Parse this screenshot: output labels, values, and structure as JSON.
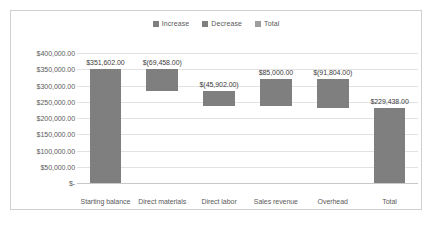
{
  "chart_data": {
    "type": "bar",
    "subtype": "waterfall",
    "title": "",
    "xlabel": "",
    "ylabel": "",
    "grid": true,
    "legend_position": "top-center",
    "ylim": [
      0,
      400000
    ],
    "ytick_values": [
      400000,
      350000,
      300000,
      250000,
      200000,
      150000,
      100000,
      50000,
      0
    ],
    "ytick_labels": [
      "$400,000.00",
      "$350,000.00",
      "$300,000.00",
      "$250,000.00",
      "$200,000.00",
      "$150,000.00",
      "$100,000.00",
      "$50,000.00",
      "$-"
    ],
    "categories": [
      "Starting balance",
      "Direct materials",
      "Direct labor",
      "Sales revenue",
      "Overhead",
      "Total"
    ],
    "data_labels": [
      "$351,602.00",
      "$(69,458.00)",
      "$(45,902.00)",
      "$85,000.00",
      "$(91,804.00)",
      "$229,438.00"
    ],
    "values": [
      351602,
      -69458,
      -45902,
      85000,
      -91804,
      229438
    ],
    "bar_kinds": [
      "total",
      "decrease",
      "decrease",
      "increase",
      "decrease",
      "total"
    ],
    "bar_bases": [
      0,
      282144,
      236242,
      236242,
      229438,
      0
    ],
    "bar_tops": [
      351602,
      351602,
      282144,
      321242,
      321242,
      229438
    ],
    "legend": [
      {
        "label": "Increase",
        "color": "#7f7f7f"
      },
      {
        "label": "Decrease",
        "color": "#7f7f7f"
      },
      {
        "label": "Total",
        "color": "#9e9e9e"
      }
    ],
    "series": [
      {
        "name": "Increase",
        "values": [
          0,
          0,
          0,
          85000,
          0,
          0
        ]
      },
      {
        "name": "Decrease",
        "values": [
          0,
          69458,
          45902,
          0,
          91804,
          0
        ]
      },
      {
        "name": "Total",
        "values": [
          351602,
          0,
          0,
          0,
          0,
          229438
        ]
      }
    ],
    "colors": {
      "bar": "#7f7f7f",
      "total_swatch": "#9e9e9e",
      "gridline": "#e2e2e2",
      "axis": "#c9c9c9",
      "text": "#5a5a5a",
      "label_text": "#3d3d3d",
      "frame": "#d0d0d0",
      "background": "#ffffff"
    }
  }
}
